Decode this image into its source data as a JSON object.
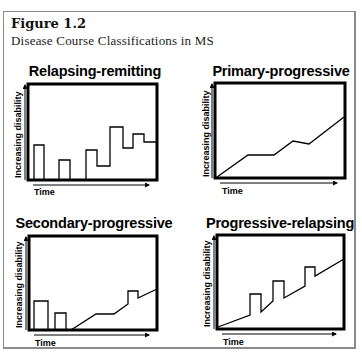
{
  "figure": {
    "label": "Figure 1.2",
    "title": "Disease Course Classifications in MS"
  },
  "panels": [
    {
      "title": "Relapsing-remitting",
      "xlabel": "Time",
      "ylabel": "Increasing disability",
      "box": {
        "x": 28,
        "y": 84,
        "w": 129,
        "h": 96
      },
      "title_pos": {
        "x": 20,
        "y": 63
      },
      "bars": [
        [
          6,
          16,
          61
        ],
        [
          31,
          42,
          76
        ]
      ],
      "path": [
        [
          58,
          95
        ],
        [
          58,
          66
        ],
        [
          69,
          66
        ],
        [
          69,
          82
        ],
        [
          82,
          82
        ],
        [
          82,
          43
        ],
        [
          95,
          43
        ],
        [
          95,
          64
        ],
        [
          105,
          64
        ],
        [
          105,
          50
        ],
        [
          116,
          50
        ],
        [
          116,
          58
        ],
        [
          129,
          58
        ]
      ]
    },
    {
      "title": "Primary-progressive",
      "xlabel": "Time",
      "ylabel": "Increasing disability",
      "box": {
        "x": 215,
        "y": 83,
        "w": 130,
        "h": 95
      },
      "title_pos": {
        "x": 213,
        "y": 63
      },
      "bars": [],
      "path": [
        [
          2,
          94
        ],
        [
          33,
          72
        ],
        [
          59,
          72
        ],
        [
          78,
          58
        ],
        [
          94,
          61
        ],
        [
          129,
          34
        ]
      ]
    },
    {
      "title": "Secondary-progressive",
      "xlabel": "Time",
      "ylabel": "Increasing disability",
      "box": {
        "x": 29,
        "y": 236,
        "w": 128,
        "h": 94
      },
      "title_pos": {
        "x": 18,
        "y": 215
      },
      "bars": [
        [
          5,
          19,
          65
        ],
        [
          26,
          37,
          77
        ]
      ],
      "path": [
        [
          42,
          94
        ],
        [
          67,
          78
        ],
        [
          85,
          78
        ],
        [
          99,
          68
        ],
        [
          99,
          55
        ],
        [
          109,
          55
        ],
        [
          109,
          62
        ],
        [
          128,
          53
        ]
      ]
    },
    {
      "title": "Progressive-relapsing",
      "xlabel": "Time",
      "ylabel": "Increasing disability",
      "box": {
        "x": 217,
        "y": 235,
        "w": 127,
        "h": 94
      },
      "title_pos": {
        "x": 207,
        "y": 215
      },
      "bars": [],
      "path": [
        [
          1,
          92
        ],
        [
          33,
          80
        ],
        [
          33,
          59
        ],
        [
          44,
          59
        ],
        [
          44,
          77
        ],
        [
          56,
          66
        ],
        [
          56,
          46
        ],
        [
          67,
          46
        ],
        [
          67,
          63
        ],
        [
          88,
          51
        ],
        [
          88,
          32
        ],
        [
          98,
          32
        ],
        [
          98,
          41
        ],
        [
          127,
          24
        ]
      ]
    }
  ],
  "colors": {
    "ink": "#000000",
    "frame": "#8a8a8a",
    "background": "#ffffff"
  }
}
